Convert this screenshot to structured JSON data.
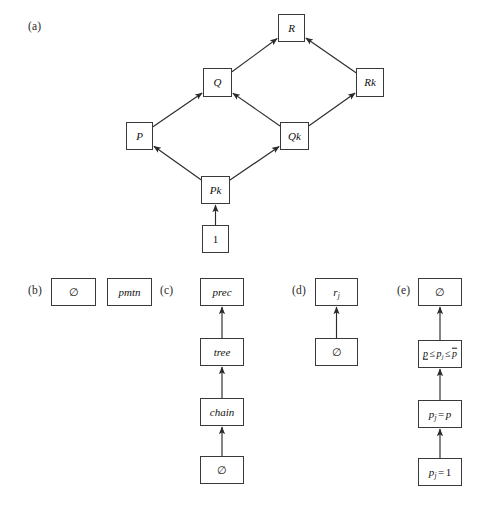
{
  "figure": {
    "background": "#ffffff",
    "box_border_color": "#3a3a3a",
    "edge_color": "#2b2b2b"
  },
  "panels": [
    {
      "id": "a",
      "label": "(a)",
      "label_x": 28,
      "label_y": 20,
      "type": "lattice",
      "nodes": [
        {
          "id": "R",
          "label": "R",
          "x": 278,
          "y": 14,
          "w": 27,
          "h": 28
        },
        {
          "id": "Q",
          "label": "Q",
          "x": 203,
          "y": 68,
          "w": 29,
          "h": 29
        },
        {
          "id": "Rk",
          "label": "Rk",
          "x": 356,
          "y": 68,
          "w": 28,
          "h": 29
        },
        {
          "id": "P",
          "label": "P",
          "x": 126,
          "y": 122,
          "w": 27,
          "h": 28
        },
        {
          "id": "Qk",
          "label": "Qk",
          "x": 280,
          "y": 122,
          "w": 29,
          "h": 28
        },
        {
          "id": "Pk",
          "label": "Pk",
          "x": 201,
          "y": 176,
          "w": 29,
          "h": 28
        },
        {
          "id": "one",
          "label": "1",
          "x": 202,
          "y": 225,
          "w": 27,
          "h": 28,
          "roman": true
        }
      ],
      "edges": [
        {
          "from": "Q",
          "to": "R"
        },
        {
          "from": "Rk",
          "to": "R"
        },
        {
          "from": "P",
          "to": "Q"
        },
        {
          "from": "Qk",
          "to": "Q"
        },
        {
          "from": "Qk",
          "to": "Rk"
        },
        {
          "from": "Pk",
          "to": "P"
        },
        {
          "from": "Pk",
          "to": "Qk"
        },
        {
          "from": "one",
          "to": "Pk"
        }
      ]
    },
    {
      "id": "b",
      "label": "(b)",
      "label_x": 28,
      "label_y": 284,
      "type": "pair",
      "nodes": [
        {
          "id": "b-empty",
          "label": "∅",
          "x": 51,
          "y": 278,
          "w": 45,
          "h": 28,
          "roman": true
        },
        {
          "id": "b-pmtn",
          "label": "pmtn",
          "x": 107,
          "y": 278,
          "w": 45,
          "h": 28
        }
      ],
      "edges": []
    },
    {
      "id": "c",
      "label": "(c)",
      "label_x": 160,
      "label_y": 284,
      "type": "chain",
      "nodes": [
        {
          "id": "c-prec",
          "label": "prec",
          "x": 200,
          "y": 278,
          "w": 44,
          "h": 28
        },
        {
          "id": "c-tree",
          "label": "tree",
          "x": 200,
          "y": 338,
          "w": 44,
          "h": 28
        },
        {
          "id": "c-chain",
          "label": "chain",
          "x": 200,
          "y": 398,
          "w": 44,
          "h": 28
        },
        {
          "id": "c-empty",
          "label": "∅",
          "x": 200,
          "y": 456,
          "w": 44,
          "h": 28,
          "roman": true
        }
      ],
      "edges": [
        {
          "from": "c-tree",
          "to": "c-prec"
        },
        {
          "from": "c-chain",
          "to": "c-tree"
        },
        {
          "from": "c-empty",
          "to": "c-chain"
        }
      ]
    },
    {
      "id": "d",
      "label": "(d)",
      "label_x": 292,
      "label_y": 284,
      "type": "chain",
      "nodes": [
        {
          "id": "d-rj",
          "label": "r<sub>j</sub>",
          "html": true,
          "x": 315,
          "y": 278,
          "w": 43,
          "h": 28
        },
        {
          "id": "d-empty",
          "label": "∅",
          "x": 315,
          "y": 338,
          "w": 43,
          "h": 28,
          "roman": true
        }
      ],
      "edges": [
        {
          "from": "d-empty",
          "to": "d-rj"
        }
      ]
    },
    {
      "id": "e",
      "label": "(e)",
      "label_x": 397,
      "label_y": 284,
      "type": "chain",
      "nodes": [
        {
          "id": "e-empty",
          "label": "∅",
          "x": 418,
          "y": 278,
          "w": 44,
          "h": 28,
          "roman": true
        },
        {
          "id": "e-range",
          "label": "<span class=\"underbar\">p</span><span class=\"op\">≤</span>p<sub>j</sub><span class=\"op\">≤</span><span class=\"overbar\">p</span>",
          "html": true,
          "text": "p ≤ p_j ≤ p̄",
          "x": 418,
          "y": 340,
          "w": 44,
          "h": 28
        },
        {
          "id": "e-pjp",
          "label": "p<sub>j</sub><span class=\"op\">=</span>p",
          "html": true,
          "text": "p_j = p",
          "x": 418,
          "y": 400,
          "w": 44,
          "h": 28
        },
        {
          "id": "e-pj1",
          "label": "p<sub>j</sub><span class=\"op\">=</span><span class=\"roman\">1</span>",
          "html": true,
          "text": "p_j = 1",
          "x": 418,
          "y": 458,
          "w": 44,
          "h": 28
        }
      ],
      "edges": [
        {
          "from": "e-range",
          "to": "e-empty"
        },
        {
          "from": "e-pjp",
          "to": "e-range"
        },
        {
          "from": "e-pj1",
          "to": "e-pjp"
        }
      ]
    }
  ]
}
